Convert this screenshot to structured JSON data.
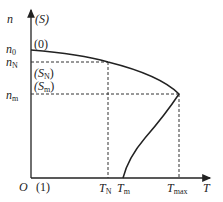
{
  "figure": {
    "axes": {
      "y_label": "n",
      "y_label_alt": "(S)",
      "x_label": "T",
      "origin_label": "O",
      "origin_alt": "(1)"
    },
    "y_ticks": [
      {
        "main": "n",
        "sub": "0",
        "alt": "(0)"
      },
      {
        "main": "n",
        "sub": "N",
        "alt": "(S",
        "alt_sub": "N",
        "alt_end": ")"
      },
      {
        "main": "n",
        "sub": "m",
        "alt": "(S",
        "alt_sub": "m",
        "alt_end": ")"
      }
    ],
    "x_ticks": [
      {
        "main": "T",
        "sub": "N"
      },
      {
        "main": "T",
        "sub": "m"
      },
      {
        "main": "T",
        "sub": "max"
      }
    ],
    "colors": {
      "curve": "#222222",
      "axis": "#222222",
      "guide": "#333333"
    }
  }
}
